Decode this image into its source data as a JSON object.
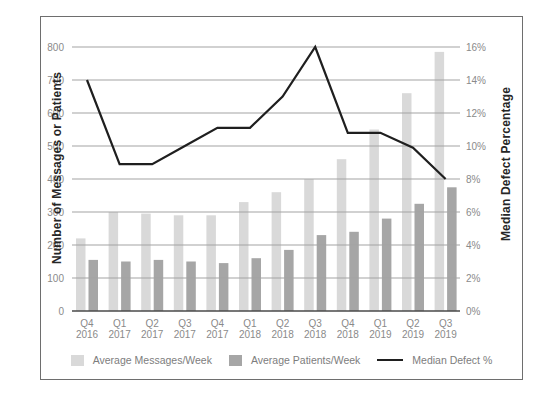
{
  "chart_data": {
    "type": "bar",
    "categories": [
      "Q4 2016",
      "Q1 2017",
      "Q2 2017",
      "Q3 2017",
      "Q4 2017",
      "Q1 2018",
      "Q2 2018",
      "Q3 2018",
      "Q4 2018",
      "Q1 2019",
      "Q2 2019",
      "Q3 2019"
    ],
    "series": [
      {
        "name": "Average Messages/Week",
        "type": "bar",
        "axis": "left",
        "color": "#d9d9d9",
        "values": [
          220,
          300,
          295,
          290,
          290,
          330,
          360,
          400,
          460,
          550,
          660,
          785
        ]
      },
      {
        "name": "Average Patients/Week",
        "type": "bar",
        "axis": "left",
        "color": "#a6a6a6",
        "values": [
          155,
          150,
          155,
          150,
          145,
          160,
          185,
          230,
          240,
          280,
          325,
          375
        ]
      },
      {
        "name": "Median Defect %",
        "type": "line",
        "axis": "right",
        "unit": "%",
        "color": "#1f1f1f",
        "values": [
          14,
          8.9,
          8.9,
          10,
          11.1,
          11.1,
          13,
          16,
          10.8,
          10.8,
          9.9,
          8
        ]
      }
    ],
    "left_axis": {
      "label": "Number of Messages or Patients",
      "min": 0,
      "max": 800,
      "tick_step": 100,
      "ticks_top_down": [
        "800",
        "700",
        "600",
        "500",
        "400",
        "300",
        "200",
        "100",
        "0"
      ]
    },
    "right_axis": {
      "label": "Median Defect Percentage",
      "min": 0,
      "max": 16,
      "tick_step": 2,
      "ticks_top_down": [
        "16%",
        "14%",
        "12%",
        "10%",
        "8%",
        "6%",
        "4%",
        "2%",
        "0%"
      ]
    },
    "grid": true,
    "legend_position": "bottom"
  },
  "colors": {
    "background": "#ffffff",
    "frame_border": "#6e6e6e",
    "gridline": "#a3a3a3",
    "axis_baseline": "#4a4a4a",
    "tick_text": "#8a8a8a",
    "category_text": "#8a8a8a",
    "legend_text": "#7d7d7d",
    "axis_title_text": "#262626"
  }
}
